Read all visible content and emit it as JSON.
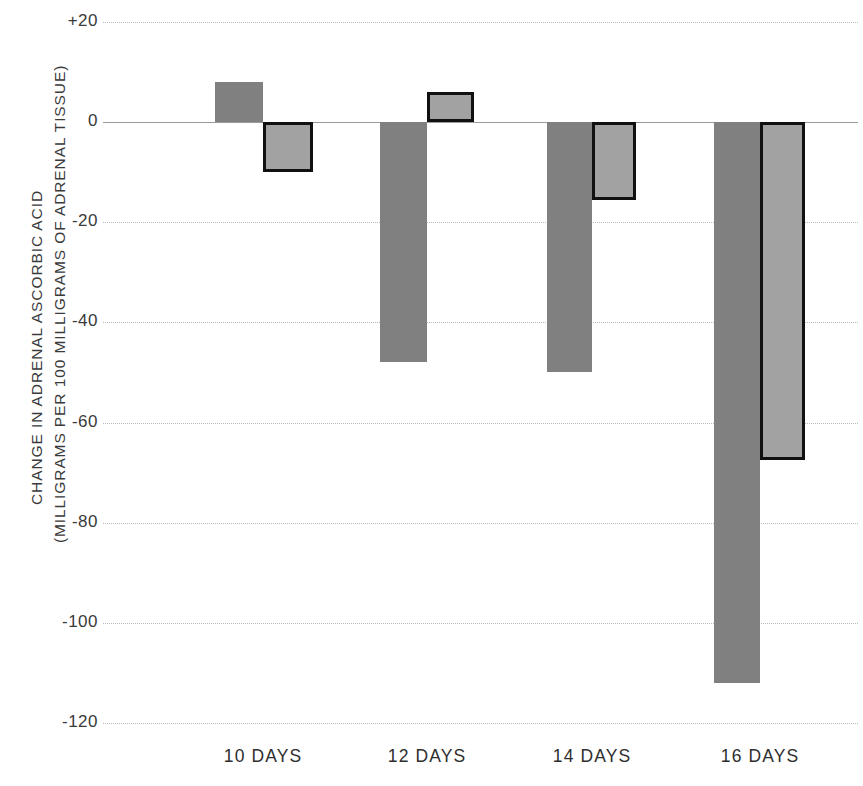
{
  "chart_data": {
    "type": "bar",
    "title": "",
    "xlabel": "",
    "ylabel": "CHANGE IN ADRENAL ASCORBIC ACID (MILLIGRAMS PER 100 MILLIGRAMS OF ADRENAL TISSUE)",
    "ylabel_line1": "CHANGE IN ADRENAL ASCORBIC ACID",
    "ylabel_line2": "(MILLIGRAMS PER 100 MILLIGRAMS OF ADRENAL TISSUE)",
    "categories": [
      "10 DAYS",
      "12 DAYS",
      "14 DAYS",
      "16 DAYS"
    ],
    "series": [
      {
        "name": "series-a-solid-gray",
        "color": "#808080",
        "border_color": "none",
        "values": [
          8,
          -48,
          -50,
          -112
        ]
      },
      {
        "name": "series-b-outlined-gray",
        "color": "#a2a2a2",
        "border_color": "#111111",
        "values": [
          -10,
          6,
          -15.5,
          -67.5
        ]
      }
    ],
    "ylim": [
      -120,
      20
    ],
    "yticks": [
      20,
      0,
      -20,
      -40,
      -60,
      -80,
      -100,
      -120
    ],
    "ytick_labels": [
      "+20",
      "0",
      "-20",
      "-40",
      "-60",
      "-80",
      "-100",
      "-120"
    ],
    "grid": true,
    "grid_style": "dotted",
    "zero_line": true,
    "legend": "none",
    "background": "#ffffff"
  }
}
